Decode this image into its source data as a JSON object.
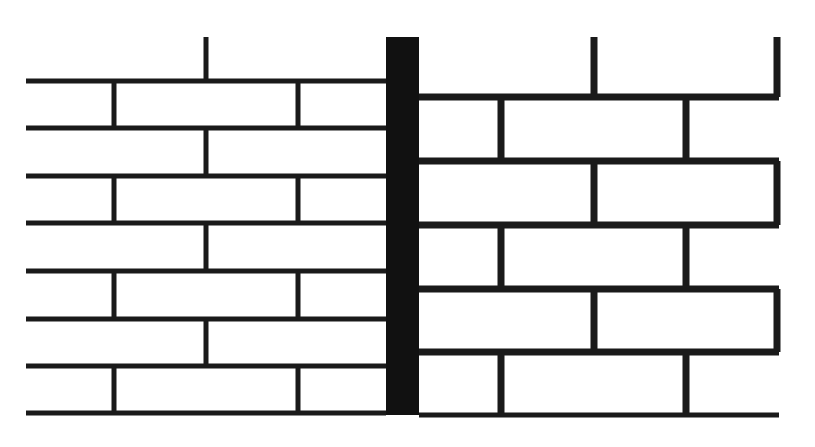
{
  "diagram": {
    "colors": {
      "mortar": "#1a1a1a",
      "brick": "#ffffff",
      "pier": "#111111",
      "background": "#ffffff"
    },
    "pier": {
      "x": 386,
      "y": 37,
      "width": 33,
      "height": 378
    },
    "left_wall": {
      "name": "left-wall",
      "x0": 26,
      "x1": 386,
      "line_thickness": 5,
      "top_stubs": [
        {
          "x": 206,
          "y0": 37,
          "y1": 81
        }
      ],
      "rows": [
        {
          "y0": 81,
          "y1": 128,
          "joints": [
            114,
            298
          ]
        },
        {
          "y0": 128,
          "y1": 176,
          "joints": [
            206
          ]
        },
        {
          "y0": 176,
          "y1": 223,
          "joints": [
            114,
            298
          ]
        },
        {
          "y0": 223,
          "y1": 271,
          "joints": [
            206
          ]
        },
        {
          "y0": 271,
          "y1": 319,
          "joints": [
            114,
            298
          ]
        },
        {
          "y0": 319,
          "y1": 366,
          "joints": [
            206
          ]
        },
        {
          "y0": 366,
          "y1": 413,
          "joints": [
            114,
            298
          ]
        }
      ]
    },
    "right_wall": {
      "name": "right-wall",
      "x0": 419,
      "x1": 779,
      "line_thickness": 7,
      "top_stubs": [
        {
          "x": 594,
          "y0": 37,
          "y1": 97
        },
        {
          "x": 777,
          "y0": 37,
          "y1": 97
        }
      ],
      "rows": [
        {
          "y0": 97,
          "y1": 161,
          "joints": [
            501,
            686
          ]
        },
        {
          "y0": 161,
          "y1": 225,
          "joints": [
            594,
            777
          ]
        },
        {
          "y0": 225,
          "y1": 289,
          "joints": [
            501,
            686
          ]
        },
        {
          "y0": 289,
          "y1": 352,
          "joints": [
            594,
            777
          ]
        },
        {
          "y0": 352,
          "y1": 415,
          "joints": [
            501,
            686
          ]
        }
      ]
    }
  }
}
